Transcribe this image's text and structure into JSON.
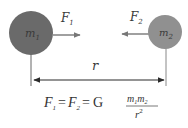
{
  "diagram": {
    "mass1": {
      "symbol": "m",
      "subscript": "1",
      "color": "#6a6a6a"
    },
    "mass2": {
      "symbol": "m",
      "subscript": "2",
      "color": "#909090"
    },
    "force1": {
      "symbol": "F",
      "subscript": "1",
      "direction": "right"
    },
    "force2": {
      "symbol": "F",
      "subscript": "2",
      "direction": "left"
    },
    "distance": {
      "symbol": "r"
    },
    "formula": {
      "lhs1": "F",
      "lhs1_sub": "1",
      "eq1": "=",
      "lhs2": "F",
      "lhs2_sub": "2",
      "eq2": "=",
      "constant": "G",
      "numerator_m1": "m",
      "numerator_m1_sub": "1",
      "numerator_m2": "m",
      "numerator_m2_sub": "2",
      "denominator": "r",
      "denominator_exp": "2"
    },
    "colors": {
      "line": "#555555",
      "arrow": "#777777",
      "text": "#333333"
    }
  }
}
